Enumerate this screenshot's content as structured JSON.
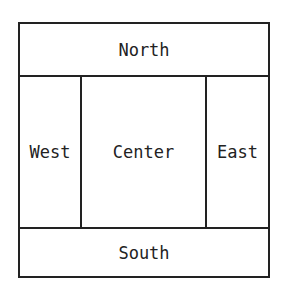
{
  "diagram": {
    "regions": {
      "north": "North",
      "west": "West",
      "center": "Center",
      "east": "East",
      "south": "South"
    }
  }
}
